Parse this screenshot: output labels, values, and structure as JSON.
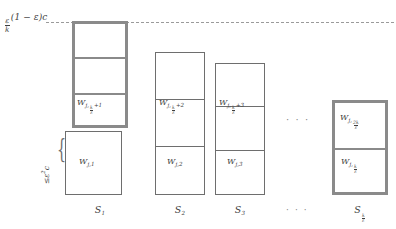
{
  "figure": {
    "threshold_label": {
      "fraction_numerator": "ε",
      "fraction_denominator": "k",
      "rest": "(1 − ε)c"
    },
    "side_label": {
      "relation": "≤",
      "epsilon": "ε",
      "exponent": "2",
      "constant": "c"
    },
    "ellipsis_mid": "· · ·",
    "ellipsis_bottom": "· · ·",
    "columns": [
      {
        "id": "S1",
        "axis_label_base": "S",
        "axis_label_sub": "1",
        "top_box_style": "thick",
        "cells": [
          {
            "label": "",
            "height": 33
          },
          {
            "label": "",
            "height": 37
          },
          {
            "label_base": "W",
            "label_sub_first": "j,",
            "label_sub_frac_num": "k",
            "label_sub_frac_den": "ε",
            "label_sub_tail": "+1",
            "height": 37
          }
        ],
        "bottom_box": {
          "style": "thin",
          "cell": {
            "label_base": "W",
            "label_sub_first": "j,1"
          }
        }
      },
      {
        "id": "S2",
        "axis_label_base": "S",
        "axis_label_sub": "2",
        "top_box_style": "thin",
        "cells": [
          {
            "label": "",
            "height": 46
          },
          {
            "label_base": "W",
            "label_sub_first": "j,",
            "label_sub_frac_num": "k",
            "label_sub_frac_den": "ε",
            "label_sub_tail": "+2",
            "height": 48
          },
          {
            "label_base": "W",
            "label_sub_first": "j,2",
            "height": 49
          }
        ]
      },
      {
        "id": "S3",
        "axis_label_base": "S",
        "axis_label_sub": "3",
        "top_box_style": "thin",
        "cells": [
          {
            "label": "",
            "height": 43
          },
          {
            "label_base": "W",
            "label_sub_first": "j,",
            "label_sub_frac_num": "k",
            "label_sub_frac_den": "ε",
            "label_sub_tail": "+3",
            "height": 45
          },
          {
            "label_base": "W",
            "label_sub_first": "j,3",
            "height": 45
          }
        ]
      },
      {
        "id": "Sk",
        "axis_label_base": "S",
        "axis_label_sub_frac_num": "k",
        "axis_label_sub_frac_den": "ε",
        "top_box_style": "thick",
        "cells": [
          {
            "label_base": "W",
            "label_sub_first": "j,",
            "label_sub_frac_num": "2k",
            "label_sub_frac_den": "ε",
            "height": 47
          },
          {
            "label_base": "W",
            "label_sub_first": "j,",
            "label_sub_frac_num": "k",
            "label_sub_frac_den": "ε",
            "height": 48
          }
        ]
      }
    ]
  }
}
